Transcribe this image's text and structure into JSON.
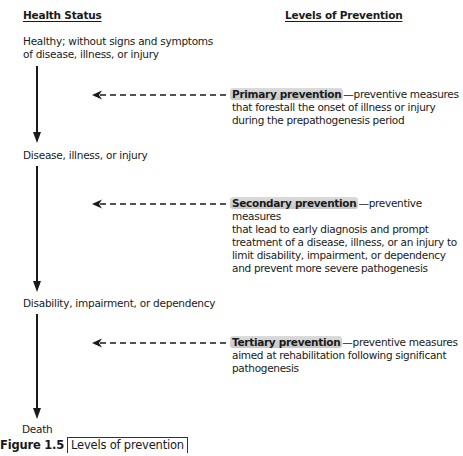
{
  "headers": {
    "health_status": "Health Status",
    "levels_of_prevention": "Levels of Prevention"
  },
  "health_states": [
    {
      "line1": "Healthy; without signs and symptoms",
      "line2": "of disease, illness, or injury"
    },
    {
      "line1": "Disease, illness, or injury"
    },
    {
      "line1": "Disability, impairment, or dependency"
    },
    {
      "line1": "Death"
    }
  ],
  "prevention_levels": [
    {
      "name": "Primary prevention",
      "dash": "—preventive measures",
      "lines": [
        "that forestall the onset of illness or injury",
        "during the prepathogenesis period"
      ]
    },
    {
      "name": "Secondary prevention",
      "dash": "—preventive measures",
      "lines": [
        "that lead to early diagnosis and prompt",
        "treatment of a disease, illness, or an injury to",
        "limit disability, impairment, or dependency",
        "and prevent more severe pathogenesis"
      ]
    },
    {
      "name": "Tertiary prevention",
      "dash": "—preventive measures",
      "lines": [
        "aimed at rehabilitation following significant",
        "pathogenesis"
      ]
    }
  ],
  "caption": {
    "figure_label": "Figure 1.5",
    "title": "Levels of prevention"
  },
  "colors": {
    "text": "#1a1a1a",
    "highlight": "#b4b4b4"
  }
}
